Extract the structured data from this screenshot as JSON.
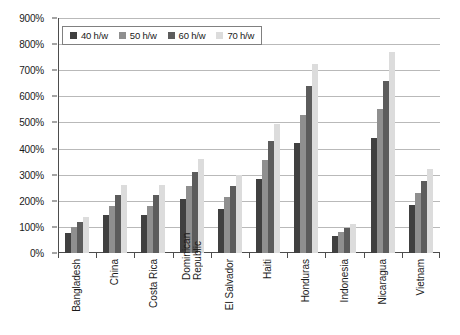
{
  "chart_data": {
    "type": "bar",
    "title": "",
    "subtitle": "",
    "xlabel": "",
    "ylabel": "",
    "ylim": [
      0,
      900
    ],
    "y_unit": "%",
    "y_ticks": [
      "0%",
      "100%",
      "200%",
      "300%",
      "400%",
      "500%",
      "600%",
      "700%",
      "800%",
      "900%"
    ],
    "y_tick_values": [
      0,
      100,
      200,
      300,
      400,
      500,
      600,
      700,
      800,
      900
    ],
    "grid": true,
    "legend_position": "top-left",
    "categories": [
      "Bangladesh",
      "China",
      "Costa Rica",
      "Dominican Republic",
      "El Salvador",
      "Haiti",
      "Honduras",
      "Indonesia",
      "Nicaragua",
      "Vietnam"
    ],
    "series": [
      {
        "name": "40 h/w",
        "color": "#404040",
        "values": [
          78,
          145,
          145,
          205,
          170,
          285,
          420,
          65,
          440,
          185
        ]
      },
      {
        "name": "50 h/w",
        "color": "#8f8f8f",
        "values": [
          100,
          180,
          180,
          255,
          215,
          355,
          530,
          80,
          550,
          230
        ]
      },
      {
        "name": "60 h/w",
        "color": "#5c5c5c",
        "values": [
          120,
          222,
          222,
          310,
          255,
          430,
          640,
          95,
          660,
          275
        ]
      },
      {
        "name": "70 h/w",
        "color": "#dcdcdc",
        "values": [
          138,
          260,
          260,
          360,
          300,
          495,
          725,
          110,
          770,
          320
        ]
      }
    ]
  },
  "legend": {
    "items": [
      {
        "label": "40 h/w"
      },
      {
        "label": "50 h/w"
      },
      {
        "label": "60 h/w"
      },
      {
        "label": "70 h/w"
      }
    ]
  }
}
